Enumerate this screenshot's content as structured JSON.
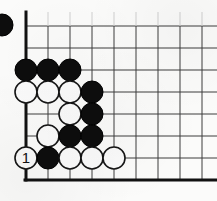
{
  "diagram": {
    "kind": "go-board-corner-diagram",
    "background_color": "#fbfbfa",
    "board": {
      "line_color": "#3c3c3c",
      "edge_color": "#111111",
      "line_width": 1,
      "edge_line_width": 3,
      "grid_spacing": 22,
      "origin_x": 26,
      "origin_y": 26,
      "columns": 9,
      "rows": 8,
      "vertical_line_x": [
        26,
        48,
        70,
        92,
        114,
        136,
        158,
        180,
        202
      ],
      "horizontal_line_y": [
        26,
        48,
        70,
        92,
        114,
        136,
        158,
        180
      ],
      "left_edge_x": 26,
      "bottom_edge_y": 180,
      "left_edge_is_border": true,
      "bottom_edge_is_border": true
    },
    "stone_style": {
      "radius": 11,
      "black_fill": "#0d0d0d",
      "black_stroke": "#000000",
      "white_fill": "#fbfbfb",
      "white_stroke": "#151515",
      "white_stroke_width": 1.6,
      "label_color": "#111111",
      "label_font_size": 15
    },
    "stones": [
      {
        "id": "b-c0-r2",
        "color": "black",
        "x": 26,
        "y": 70,
        "label": ""
      },
      {
        "id": "b-c1-r2",
        "color": "black",
        "x": 48,
        "y": 70,
        "label": ""
      },
      {
        "id": "b-c2-r2",
        "color": "black",
        "x": 70,
        "y": 70,
        "label": ""
      },
      {
        "id": "w-c0-r3",
        "color": "white",
        "x": 26,
        "y": 92,
        "label": ""
      },
      {
        "id": "w-c1-r3",
        "color": "white",
        "x": 48,
        "y": 92,
        "label": ""
      },
      {
        "id": "w-c2-r3",
        "color": "white",
        "x": 70,
        "y": 92,
        "label": ""
      },
      {
        "id": "b-c3-r3",
        "color": "black",
        "x": 92,
        "y": 92,
        "label": ""
      },
      {
        "id": "w-c2-r4",
        "color": "white",
        "x": 70,
        "y": 114,
        "label": ""
      },
      {
        "id": "b-c3-r4",
        "color": "black",
        "x": 92,
        "y": 114,
        "label": ""
      },
      {
        "id": "w-c1-r5",
        "color": "white",
        "x": 48,
        "y": 136,
        "label": ""
      },
      {
        "id": "b-c2-r5",
        "color": "black",
        "x": 70,
        "y": 136,
        "label": ""
      },
      {
        "id": "b-c3-r5",
        "color": "black",
        "x": 92,
        "y": 136,
        "label": ""
      },
      {
        "id": "w-c0-r6-move1",
        "color": "white",
        "x": 26,
        "y": 158,
        "label": "1"
      },
      {
        "id": "b-c1-r6",
        "color": "black",
        "x": 48,
        "y": 158,
        "label": ""
      },
      {
        "id": "w-c2-r6",
        "color": "white",
        "x": 70,
        "y": 158,
        "label": ""
      },
      {
        "id": "w-c3-r6",
        "color": "white",
        "x": 92,
        "y": 158,
        "label": ""
      },
      {
        "id": "w-c4-r6",
        "color": "white",
        "x": 114,
        "y": 158,
        "label": ""
      }
    ],
    "clipped_stones": [
      {
        "id": "b-offboard-left",
        "color": "black",
        "x": 2,
        "y": 25,
        "radius": 11
      }
    ],
    "move_labels": [
      {
        "number": "1",
        "stone_id": "w-c0-r6-move1",
        "color": "white"
      }
    ]
  }
}
